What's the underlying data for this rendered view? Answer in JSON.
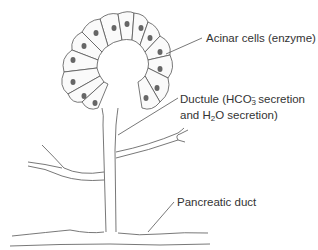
{
  "diagram": {
    "labels": {
      "acinar": "Acinar cells (enzyme)",
      "ductule_line1_prefix": "Ductule (HCO",
      "ductule_line1_sub": "3",
      "ductule_line1_sup": "−",
      "ductule_line1_suffix": " secretion",
      "ductule_line2_prefix": "and H",
      "ductule_line2_sub": "2",
      "ductule_line2_suffix": "O secretion)",
      "pancreatic_duct": "Pancreatic duct"
    },
    "colors": {
      "stroke": "#555555",
      "text": "#333333",
      "background": "#ffffff"
    }
  }
}
